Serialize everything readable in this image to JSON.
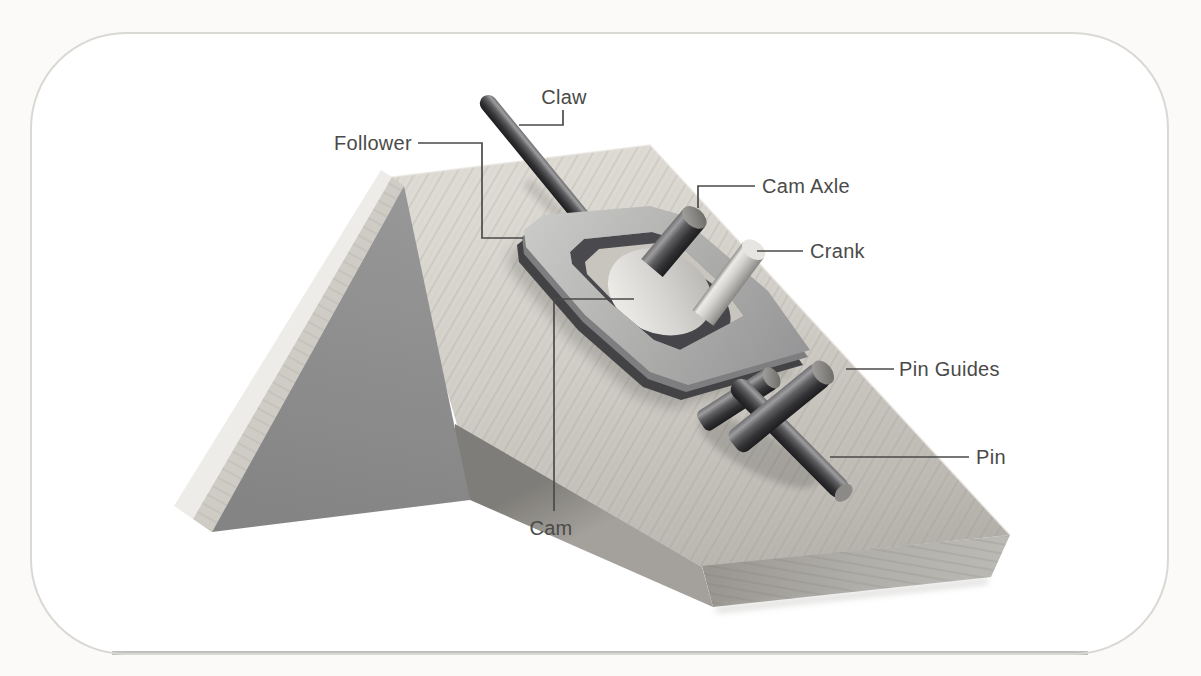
{
  "diagram": {
    "style": "grayscale 3D illustration inside a rounded-rectangle panel",
    "labels": [
      {
        "id": "claw",
        "text": "Claw"
      },
      {
        "id": "follower",
        "text": "Follower"
      },
      {
        "id": "cam_axle",
        "text": "Cam Axle"
      },
      {
        "id": "crank",
        "text": "Crank"
      },
      {
        "id": "pin_guides",
        "text": "Pin Guides"
      },
      {
        "id": "pin",
        "text": "Pin"
      },
      {
        "id": "cam",
        "text": "Cam"
      }
    ],
    "colors": {
      "panel_background": "#ffffff",
      "panel_border": "#d9d8d5",
      "page_background": "#fbfaf8",
      "wood_light": "#d5d2cc",
      "wood_shadow": "#908d88",
      "wedge_face": "#8e8e8e",
      "metal_dark": "#3c3c3e",
      "metal_light": "#d2d0cc",
      "label_text": "#4a4a48"
    }
  }
}
